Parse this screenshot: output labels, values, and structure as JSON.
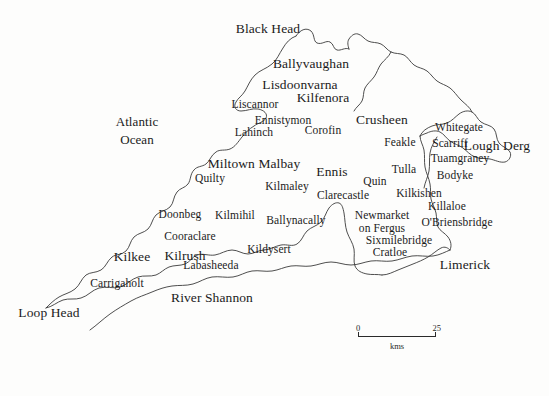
{
  "map": {
    "title": "County Clare and the Shannon Estuary",
    "background_color": "#fdfdfc",
    "line_color": "#3a3a3a",
    "text_color": "#1b1b1b",
    "water_labels": [
      {
        "name": "atlantic-ocean",
        "line1": "Atlantic",
        "line2": "Ocean",
        "x": 137,
        "y": 131
      },
      {
        "name": "river-shannon",
        "text": "River Shannon",
        "x": 212,
        "y": 298
      },
      {
        "name": "lough-derg",
        "text": "Lough Derg",
        "x": 497,
        "y": 146
      }
    ],
    "headlands": [
      {
        "name": "black-head",
        "text": "Black Head",
        "x": 268,
        "y": 29
      },
      {
        "name": "loop-head",
        "text": "Loop Head",
        "x": 49,
        "y": 313
      }
    ],
    "places": [
      {
        "name": "ballyvaughan",
        "text": "Ballyvaughan",
        "x": 311,
        "y": 64
      },
      {
        "name": "lisdoonvarna",
        "text": "Lisdoonvarna",
        "x": 300,
        "y": 85
      },
      {
        "name": "kilfenora",
        "text": "Kilfenora",
        "x": 323,
        "y": 98
      },
      {
        "name": "liscannor",
        "text": "Liscannor",
        "x": 255,
        "y": 105
      },
      {
        "name": "ennistymon",
        "text": "Ennistymon",
        "x": 283,
        "y": 121
      },
      {
        "name": "lahinch",
        "text": "Lahinch",
        "x": 254,
        "y": 133
      },
      {
        "name": "corofin",
        "text": "Corofin",
        "x": 323,
        "y": 131
      },
      {
        "name": "crusheen",
        "text": "Crusheen",
        "x": 382,
        "y": 120
      },
      {
        "name": "whitegate",
        "text": "Whitegate",
        "x": 459,
        "y": 128
      },
      {
        "name": "feakle",
        "text": "Feakle",
        "x": 400,
        "y": 143
      },
      {
        "name": "scarriff",
        "text": "Scarriff",
        "x": 450,
        "y": 144
      },
      {
        "name": "tuamgraney",
        "text": "Tuamgraney",
        "x": 460,
        "y": 159
      },
      {
        "name": "miltown-malbay",
        "text": "Miltown Malbay",
        "x": 254,
        "y": 164
      },
      {
        "name": "ennis",
        "text": "Ennis",
        "x": 332,
        "y": 172
      },
      {
        "name": "tulla",
        "text": "Tulla",
        "x": 404,
        "y": 170
      },
      {
        "name": "bodyke",
        "text": "Bodyke",
        "x": 455,
        "y": 176
      },
      {
        "name": "quilty",
        "text": "Quilty",
        "x": 210,
        "y": 179
      },
      {
        "name": "kilmaley",
        "text": "Kilmaley",
        "x": 287,
        "y": 187
      },
      {
        "name": "quin",
        "text": "Quin",
        "x": 375,
        "y": 182
      },
      {
        "name": "clarecastle",
        "text": "Clarecastle",
        "x": 343,
        "y": 196
      },
      {
        "name": "kilkishen",
        "text": "Kilkishen",
        "x": 419,
        "y": 194
      },
      {
        "name": "killaloe",
        "text": "Killaloe",
        "x": 447,
        "y": 207
      },
      {
        "name": "doonbeg",
        "text": "Doonbeg",
        "x": 180,
        "y": 215
      },
      {
        "name": "kilmihil",
        "text": "Kilmihil",
        "x": 235,
        "y": 216
      },
      {
        "name": "ballynacally",
        "text": "Ballynacally",
        "x": 296,
        "y": 221
      },
      {
        "name": "newmarket-on-fergus",
        "line1": "Newmarket",
        "line2": "on Fergus",
        "x": 382,
        "y": 222
      },
      {
        "name": "obriensbridge",
        "text": "O'Briensbridge",
        "x": 457,
        "y": 223
      },
      {
        "name": "cooraclare",
        "text": "Cooraclare",
        "x": 190,
        "y": 237
      },
      {
        "name": "kildysert",
        "text": "Kildysert",
        "x": 269,
        "y": 250
      },
      {
        "name": "sixmilebridge",
        "text": "Sixmilebridge",
        "x": 399,
        "y": 241
      },
      {
        "name": "cratloe",
        "text": "Cratloe",
        "x": 390,
        "y": 253
      },
      {
        "name": "kilkee",
        "text": "Kilkee",
        "x": 132,
        "y": 257
      },
      {
        "name": "kilrush",
        "text": "Kilrush",
        "x": 185,
        "y": 256
      },
      {
        "name": "labasheeda",
        "text": "Labasheeda",
        "x": 211,
        "y": 266
      },
      {
        "name": "limerick",
        "text": "Limerick",
        "x": 465,
        "y": 265
      },
      {
        "name": "carrigaholt",
        "text": "Carrigaholt",
        "x": 117,
        "y": 284
      }
    ]
  },
  "scale": {
    "name": "scale-bar",
    "min": "0",
    "max": "25",
    "unit": "kms"
  }
}
